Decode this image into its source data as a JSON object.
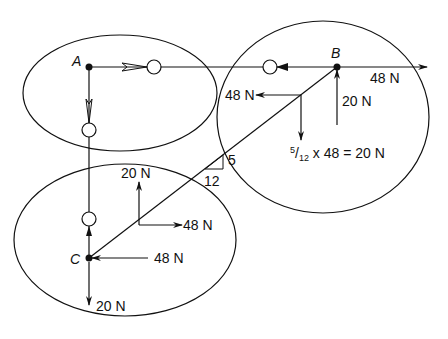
{
  "diagram": {
    "type": "free-body / method-of-joints truss diagram",
    "joints": [
      {
        "id": "A",
        "label": "A"
      },
      {
        "id": "B",
        "label": "B"
      },
      {
        "id": "C",
        "label": "C"
      }
    ],
    "members": [
      {
        "from": "A",
        "to": "B",
        "force": "0 (zero-force)"
      },
      {
        "from": "A",
        "to": "C",
        "force": "0 (zero-force)"
      },
      {
        "from": "B",
        "to": "C",
        "slope": "5/12"
      }
    ],
    "labels": {
      "b_applied_horizontal": "48 N",
      "b_reaction_vertical": "20 N",
      "b_component_horizontal": "48 N",
      "b_component_vertical_prefix_num": "5",
      "b_component_vertical_prefix_den": "12",
      "b_component_vertical_rest": " x 48 = 20 N",
      "slope_rise": "5",
      "slope_run": "12",
      "mid_component_vertical": "20 N",
      "mid_component_horizontal": "48 N",
      "c_reaction_horizontal": "48 N",
      "c_reaction_vertical": "20 N"
    },
    "colors": {
      "ink": "#111111",
      "background": "#ffffff"
    }
  }
}
